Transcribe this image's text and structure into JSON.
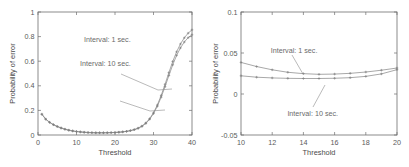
{
  "figure": {
    "panels": [
      "left",
      "right"
    ]
  },
  "chart_data": [
    {
      "id": "left-panel",
      "type": "line",
      "title": "",
      "xlabel": "Threshold",
      "ylabel": "Probability of error",
      "xlim": [
        0,
        40
      ],
      "ylim": [
        0,
        1
      ],
      "xticks": [
        0,
        10,
        20,
        30,
        40
      ],
      "xticklabels": [
        "0",
        "10",
        "20",
        "30",
        "40"
      ],
      "yticks": [
        0,
        0.2,
        0.4,
        0.6,
        0.8,
        1
      ],
      "yticklabels": [
        "0",
        "0.2",
        "0.4",
        "0.6",
        "0.8",
        "1"
      ],
      "grid": false,
      "legend_position": "inline-annotations",
      "annotations": [
        {
          "text": "Interval: 1 sec.",
          "x": 18.0,
          "y": 0.76
        },
        {
          "text": "Interval: 10 sec.",
          "x": 17.5,
          "y": 0.565
        }
      ],
      "marker": "plus",
      "x": [
        1,
        2,
        3,
        4,
        5,
        6,
        7,
        8,
        9,
        10,
        11,
        12,
        13,
        14,
        15,
        16,
        17,
        18,
        19,
        20,
        21,
        22,
        23,
        24,
        25,
        26,
        27,
        28,
        29,
        30,
        31,
        32,
        33,
        34,
        35,
        36,
        37,
        38,
        39,
        40
      ],
      "series": [
        {
          "name": "Interval: 1 sec.",
          "values": [
            0.17,
            0.13,
            0.104,
            0.085,
            0.07,
            0.058,
            0.048,
            0.04,
            0.034,
            0.029,
            0.026,
            0.023,
            0.021,
            0.02,
            0.019,
            0.019,
            0.019,
            0.019,
            0.02,
            0.021,
            0.023,
            0.026,
            0.03,
            0.036,
            0.044,
            0.056,
            0.073,
            0.098,
            0.133,
            0.181,
            0.244,
            0.322,
            0.412,
            0.507,
            0.598,
            0.676,
            0.74,
            0.79,
            0.828,
            0.855
          ]
        },
        {
          "name": "Interval: 10 sec.",
          "values": [
            0.168,
            0.128,
            0.102,
            0.083,
            0.068,
            0.056,
            0.046,
            0.038,
            0.032,
            0.027,
            0.024,
            0.021,
            0.019,
            0.018,
            0.017,
            0.017,
            0.017,
            0.018,
            0.019,
            0.02,
            0.022,
            0.025,
            0.029,
            0.035,
            0.043,
            0.054,
            0.07,
            0.094,
            0.128,
            0.174,
            0.234,
            0.308,
            0.393,
            0.484,
            0.571,
            0.647,
            0.708,
            0.756,
            0.791,
            0.815
          ]
        }
      ]
    },
    {
      "id": "right-panel",
      "type": "line",
      "title": "",
      "xlabel": "Threshold",
      "ylabel": "Probability of error",
      "xlim": [
        10,
        20
      ],
      "ylim": [
        -0.05,
        0.1
      ],
      "xticks": [
        10,
        12,
        14,
        16,
        18,
        20
      ],
      "xticklabels": [
        "10",
        "12",
        "14",
        "16",
        "18",
        "20"
      ],
      "yticks": [
        -0.05,
        0,
        0.05,
        0.1
      ],
      "yticklabels": [
        "-0.05",
        "0",
        "0.05",
        "0.1"
      ],
      "grid": false,
      "legend_position": "inline-annotations",
      "annotations": [
        {
          "text": "Interval: 1 sec.",
          "x": 13.4,
          "y": 0.0505
        },
        {
          "text": "Interval: 10 sec.",
          "x": 14.6,
          "y": -0.0265
        }
      ],
      "marker": "plus",
      "x": [
        10,
        11,
        12,
        13,
        14,
        15,
        16,
        17,
        18,
        19,
        20
      ],
      "series": [
        {
          "name": "Interval: 1 sec.",
          "values": [
            0.0385,
            0.0335,
            0.0295,
            0.0265,
            0.0248,
            0.024,
            0.0243,
            0.0252,
            0.0268,
            0.029,
            0.0317
          ]
        },
        {
          "name": "Interval: 10 sec.",
          "values": [
            0.0222,
            0.0205,
            0.0196,
            0.0191,
            0.0189,
            0.0189,
            0.0192,
            0.0199,
            0.0215,
            0.0245,
            0.0297
          ]
        }
      ]
    }
  ]
}
